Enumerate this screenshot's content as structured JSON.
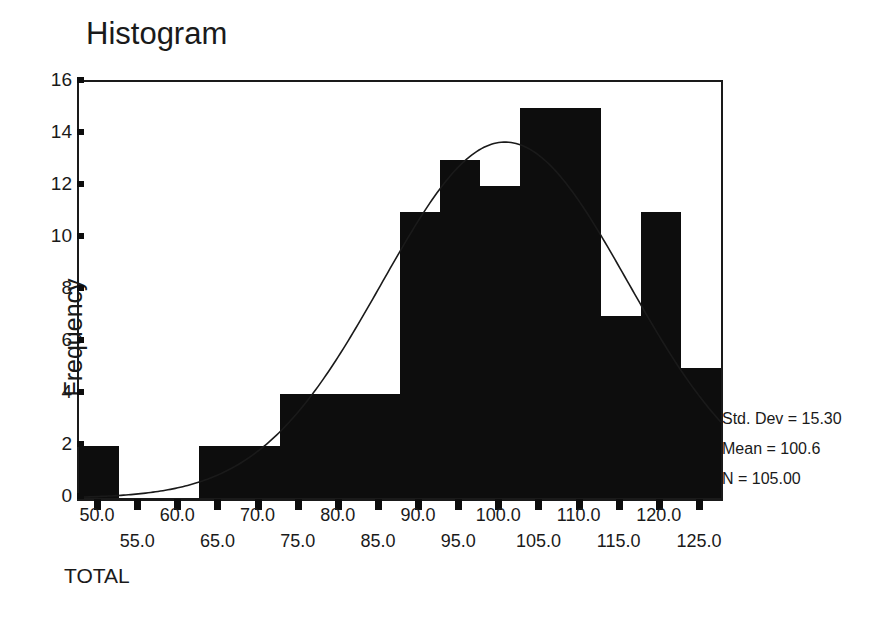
{
  "chart_data": {
    "type": "bar",
    "title": "Histogram",
    "xlabel": "TOTAL",
    "ylabel": "Frequency",
    "grid": false,
    "legend": null,
    "xlim": [
      47.5,
      127.5
    ],
    "ylim": [
      0,
      16
    ],
    "bin_width": 5,
    "categories": [
      "47.5-52.5",
      "52.5-57.5",
      "57.5-62.5",
      "62.5-67.5",
      "67.5-72.5",
      "72.5-77.5",
      "77.5-82.5",
      "82.5-87.5",
      "87.5-92.5",
      "92.5-97.5",
      "97.5-102.5",
      "102.5-107.5",
      "107.5-112.5",
      "112.5-117.5",
      "117.5-122.5",
      "122.5-127.5"
    ],
    "bin_centers": [
      50,
      55,
      60,
      65,
      70,
      75,
      80,
      85,
      90,
      95,
      100,
      105,
      110,
      115,
      120,
      125
    ],
    "values": [
      2,
      0,
      0,
      2,
      2,
      4,
      4,
      4,
      11,
      13,
      12,
      15,
      15,
      7,
      11,
      5
    ],
    "y_ticks": [
      0,
      2,
      4,
      6,
      8,
      10,
      12,
      14,
      16
    ],
    "x_ticks_upper": [
      "50.0",
      "60.0",
      "70.0",
      "80.0",
      "90.0",
      "100.0",
      "110.0",
      "120.0"
    ],
    "x_ticks_upper_values": [
      50,
      60,
      70,
      80,
      90,
      100,
      110,
      120
    ],
    "x_ticks_lower": [
      "55.0",
      "65.0",
      "75.0",
      "85.0",
      "95.0",
      "105.0",
      "115.0",
      "125.0"
    ],
    "x_ticks_lower_values": [
      55,
      65,
      75,
      85,
      95,
      105,
      115,
      125
    ],
    "overlay": {
      "type": "normal-curve",
      "mean": 100.6,
      "std_dev": 15.3,
      "n": 105
    }
  },
  "annotations": {
    "std_dev": "Std. Dev = 15.30",
    "mean": "Mean = 100.6",
    "n": "N = 105.00"
  },
  "colors": {
    "bar_fill": "#0d0d0d",
    "axis": "#1a1a1a",
    "background": "#ffffff",
    "curve": "#1a1a1a"
  }
}
